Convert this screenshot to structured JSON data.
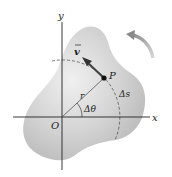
{
  "diagram": {
    "type": "rigid-body-rotation",
    "labels": {
      "y_axis": "y",
      "x_axis": "x",
      "origin": "O",
      "point": "P",
      "velocity": "v",
      "radius": "r",
      "angle": "Δθ",
      "arc": "Δs"
    },
    "colors": {
      "body_fill": "#c9c9c9",
      "body_highlight": "#ececec",
      "axis": "#222222",
      "arrow": "#555555",
      "rotation_arrow": "#9a9a9a"
    }
  }
}
